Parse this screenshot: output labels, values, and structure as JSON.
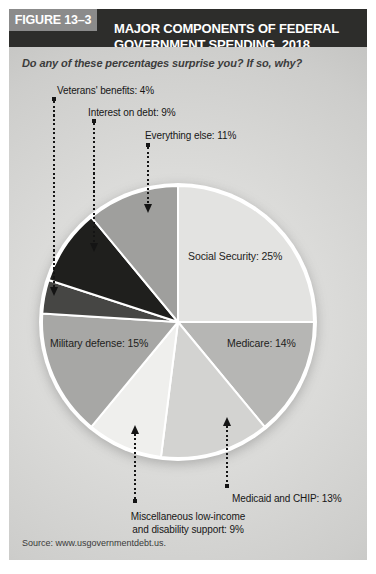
{
  "header": {
    "figure_label": "FIGURE 13–3",
    "title_line1": "MAJOR COMPONENTS OF FEDERAL",
    "title_line2": "GOVERNMENT SPENDING, 2018"
  },
  "question": "Do any of these percentages surprise you? If so, why?",
  "source": "Source: www.usgovernmentdebt.us.",
  "colors": {
    "title_bar_bg": "#2d2d2b",
    "figure_label_bg": "#8b8b8b",
    "pie_outline": "#ffffff",
    "connector": "#141414"
  },
  "chart_data": {
    "type": "pie",
    "title": "Major Components of Federal Government Spending, 2018",
    "units": "percent of total federal spending",
    "direction": "clockwise",
    "start_angle_deg": 0,
    "slices": [
      {
        "id": "social-security",
        "label": "Social Security",
        "value": 25,
        "display": "Social Security: 25%",
        "color": "#e3e3e1",
        "label_placement": "inside"
      },
      {
        "id": "medicare",
        "label": "Medicare",
        "value": 14,
        "display": "Medicare: 14%",
        "color": "#b6b6b4",
        "label_placement": "inside"
      },
      {
        "id": "medicaid-chip",
        "label": "Medicaid and CHIP",
        "value": 13,
        "display": "Medicaid and CHIP: 13%",
        "color": "#d3d3d1",
        "label_placement": "outside"
      },
      {
        "id": "miscellaneous-support",
        "label": "Miscellaneous low-income and disability support",
        "value": 9,
        "display": "Miscellaneous low-income\nand disability support: 9%",
        "color": "#efefed",
        "label_placement": "outside"
      },
      {
        "id": "military-defense",
        "label": "Military defense",
        "value": 15,
        "display": "Military defense: 15%",
        "color": "#a7a7a5",
        "label_placement": "inside"
      },
      {
        "id": "veterans-benefits",
        "label": "Veterans' benefits",
        "value": 4,
        "display": "Veterans' benefits: 4%",
        "color": "#464644",
        "label_placement": "outside"
      },
      {
        "id": "interest-on-debt",
        "label": "Interest on debt",
        "value": 9,
        "display": "Interest on debt: 9%",
        "color": "#1f1f1d",
        "label_placement": "outside"
      },
      {
        "id": "everything-else",
        "label": "Everything else",
        "value": 11,
        "display": "Everything else: 11%",
        "color": "#9f9f9d",
        "label_placement": "outside"
      }
    ]
  }
}
